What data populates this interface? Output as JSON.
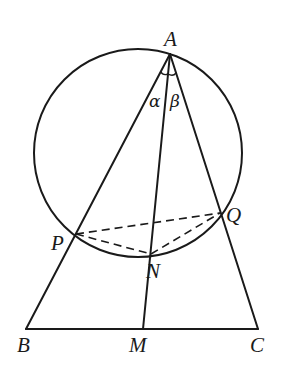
{
  "figure": {
    "type": "geometry",
    "colors": {
      "stroke": "#1a1a1a",
      "background": "#ffffff"
    }
  },
  "points": {
    "A": {
      "label": "A",
      "x": 170,
      "y": 54
    },
    "B": {
      "label": "B",
      "x": 26,
      "y": 329
    },
    "C": {
      "label": "C",
      "x": 258,
      "y": 329
    },
    "M": {
      "label": "M",
      "x": 143,
      "y": 329
    },
    "P": {
      "label": "P",
      "x": 76,
      "y": 234
    },
    "Q": {
      "label": "Q",
      "x": 220,
      "y": 213
    },
    "N": {
      "label": "N",
      "x": 151,
      "y": 254
    }
  },
  "circle": {
    "cx": 138,
    "cy": 153,
    "r": 104,
    "passes_through": [
      "A",
      "P",
      "N",
      "Q"
    ]
  },
  "angles": {
    "alpha": {
      "label": "α",
      "between": [
        "AB",
        "AM"
      ]
    },
    "beta": {
      "label": "β",
      "between": [
        "AM",
        "AC"
      ]
    }
  },
  "segments_solid": [
    "AB",
    "AC",
    "AM",
    "BC"
  ],
  "segments_dashed": [
    "PQ",
    "PN",
    "NQ"
  ]
}
